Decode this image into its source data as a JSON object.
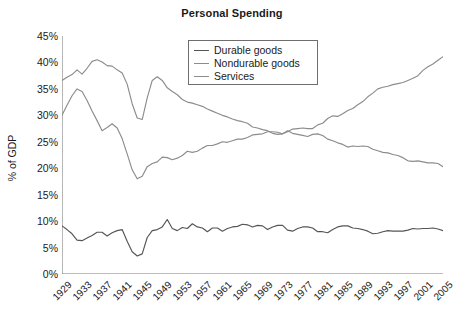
{
  "chart_data": {
    "type": "line",
    "title": "Personal Spending",
    "xlabel": "",
    "ylabel": "% of GDP",
    "xlim": [
      1929,
      2005
    ],
    "ylim": [
      0,
      45
    ],
    "grid": false,
    "legend_position": "top-center",
    "y_ticks": [
      "45%",
      "40%",
      "35%",
      "30%",
      "25%",
      "20%",
      "15%",
      "10%",
      "5%",
      "0%"
    ],
    "y_tick_values": [
      45,
      40,
      35,
      30,
      25,
      20,
      15,
      10,
      5,
      0
    ],
    "x_ticks": [
      "1929",
      "1933",
      "1937",
      "1941",
      "1945",
      "1949",
      "1953",
      "1957",
      "1961",
      "1965",
      "1969",
      "1973",
      "1977",
      "1981",
      "1985",
      "1989",
      "1993",
      "1997",
      "2001",
      "2005"
    ],
    "x_tick_values": [
      1929,
      1933,
      1937,
      1941,
      1945,
      1949,
      1953,
      1957,
      1961,
      1965,
      1969,
      1973,
      1977,
      1981,
      1985,
      1989,
      1993,
      1997,
      2001,
      2005
    ],
    "x": [
      1929,
      1930,
      1931,
      1932,
      1933,
      1934,
      1935,
      1936,
      1937,
      1938,
      1939,
      1940,
      1941,
      1942,
      1943,
      1944,
      1945,
      1946,
      1947,
      1948,
      1949,
      1950,
      1951,
      1952,
      1953,
      1954,
      1955,
      1956,
      1957,
      1958,
      1959,
      1960,
      1961,
      1962,
      1963,
      1964,
      1965,
      1966,
      1967,
      1968,
      1969,
      1970,
      1971,
      1972,
      1973,
      1974,
      1975,
      1976,
      1977,
      1978,
      1979,
      1980,
      1981,
      1982,
      1983,
      1984,
      1985,
      1986,
      1987,
      1988,
      1989,
      1990,
      1991,
      1992,
      1993,
      1994,
      1995,
      1996,
      1997,
      1998,
      1999,
      2000,
      2001,
      2002,
      2003,
      2004,
      2005
    ],
    "series": [
      {
        "name": "Durable goods",
        "color": "#555555",
        "values": [
          9.1,
          8.4,
          7.6,
          6.4,
          6.3,
          6.8,
          7.3,
          7.9,
          7.9,
          7.2,
          7.8,
          8.2,
          8.4,
          6.2,
          4.2,
          3.4,
          3.8,
          6.9,
          8.2,
          8.4,
          8.9,
          10.3,
          8.6,
          8.2,
          8.8,
          8.6,
          9.5,
          8.9,
          8.7,
          8.0,
          8.7,
          8.7,
          8.1,
          8.6,
          8.9,
          9.0,
          9.4,
          9.3,
          8.9,
          9.2,
          9.1,
          8.4,
          8.9,
          9.2,
          9.2,
          8.3,
          8.1,
          8.6,
          8.9,
          8.9,
          8.7,
          8.0,
          8.0,
          7.8,
          8.4,
          8.9,
          9.1,
          9.1,
          8.7,
          8.6,
          8.4,
          8.1,
          7.6,
          7.7,
          8.0,
          8.2,
          8.1,
          8.1,
          8.1,
          8.3,
          8.6,
          8.5,
          8.6,
          8.6,
          8.7,
          8.5,
          8.2
        ]
      },
      {
        "name": "Nondurable goods",
        "color": "#8c8c8c",
        "values": [
          36.6,
          37.2,
          37.7,
          38.6,
          37.8,
          38.9,
          40.2,
          40.5,
          40.1,
          39.4,
          39.3,
          38.6,
          38.0,
          35.9,
          32.2,
          29.5,
          29.2,
          33.3,
          36.6,
          37.3,
          36.6,
          35.2,
          34.5,
          33.9,
          33.0,
          32.5,
          32.3,
          32.0,
          31.7,
          31.2,
          30.8,
          30.4,
          30.0,
          29.7,
          29.3,
          29.0,
          28.8,
          28.5,
          27.8,
          27.6,
          27.3,
          27.1,
          26.6,
          26.4,
          26.5,
          27.1,
          26.6,
          26.4,
          26.2,
          26.0,
          26.4,
          26.5,
          26.2,
          25.5,
          25.2,
          24.8,
          24.5,
          24.0,
          24.2,
          24.1,
          24.2,
          24.1,
          23.6,
          23.3,
          23.0,
          22.9,
          22.6,
          22.4,
          22.0,
          21.4,
          21.3,
          21.4,
          21.2,
          21.0,
          21.0,
          20.9,
          20.3
        ]
      },
      {
        "name": "Services",
        "color": "#8c8c8c",
        "values": [
          30.0,
          31.9,
          33.7,
          35.0,
          34.5,
          32.8,
          30.8,
          29.0,
          27.1,
          27.7,
          28.4,
          27.6,
          25.6,
          22.7,
          19.7,
          18.0,
          18.5,
          20.3,
          20.9,
          21.2,
          22.1,
          22.0,
          21.6,
          21.9,
          22.4,
          23.2,
          23.0,
          23.2,
          23.8,
          24.3,
          24.3,
          24.6,
          25.0,
          24.9,
          25.2,
          25.5,
          25.5,
          25.8,
          26.3,
          26.4,
          26.5,
          26.9,
          26.9,
          26.8,
          26.5,
          26.9,
          27.4,
          27.5,
          27.6,
          27.5,
          27.5,
          28.2,
          28.5,
          29.4,
          29.9,
          29.8,
          30.3,
          30.9,
          31.3,
          32.0,
          32.6,
          33.5,
          34.2,
          35.0,
          35.3,
          35.5,
          35.8,
          36.0,
          36.2,
          36.6,
          37.0,
          37.5,
          38.5,
          39.2,
          39.7,
          40.4,
          41.1
        ]
      }
    ]
  },
  "axis": {
    "color": "#7a7a7a"
  }
}
